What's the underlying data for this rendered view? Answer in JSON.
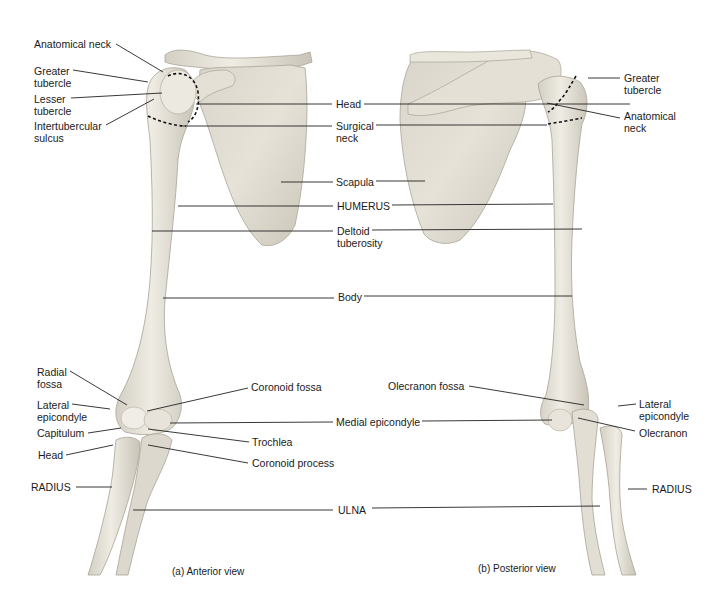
{
  "figure": {
    "colors": {
      "bone_fill": "#e9e6dc",
      "bone_shade": "#cfcabd",
      "bone_dark": "#b9b3a5",
      "leader_line": "#222222",
      "background": "#ffffff"
    }
  },
  "panels": [
    {
      "id": "anterior",
      "caption": "(a) Anterior view",
      "labels": {
        "anatomical_neck": "Anatomical neck",
        "greater_tubercle": "Greater\ntubercle",
        "lesser_tubercle": "Lesser\ntubercle",
        "intertubercular_sulcus": "Intertubercular\nsulcus",
        "radial_fossa": "Radial\nfossa",
        "lateral_epicondyle": "Lateral\nepicondyle",
        "capitulum": "Capitulum",
        "head": "Head",
        "radius": "RADIUS",
        "coronoid_fossa": "Coronoid fossa",
        "trochlea": "Trochlea",
        "coronoid_process": "Coronoid process"
      }
    },
    {
      "id": "posterior",
      "caption": "(b) Posterior view",
      "labels": {
        "greater_tubercle": "Greater\ntubercle",
        "anatomical_neck": "Anatomical\nneck",
        "olecranon_fossa": "Olecranon fossa",
        "lateral_epicondyle": "Lateral\nepicondyle",
        "olecranon": "Olecranon",
        "radius": "RADIUS"
      }
    }
  ],
  "shared_labels": {
    "head": "Head",
    "surgical_neck": "Surgical\nneck",
    "scapula": "Scapula",
    "humerus": "HUMERUS",
    "deltoid_tuberosity": "Deltoid\ntuberosity",
    "body": "Body",
    "medial_epicondyle": "Medial epicondyle",
    "ulna": "ULNA"
  }
}
